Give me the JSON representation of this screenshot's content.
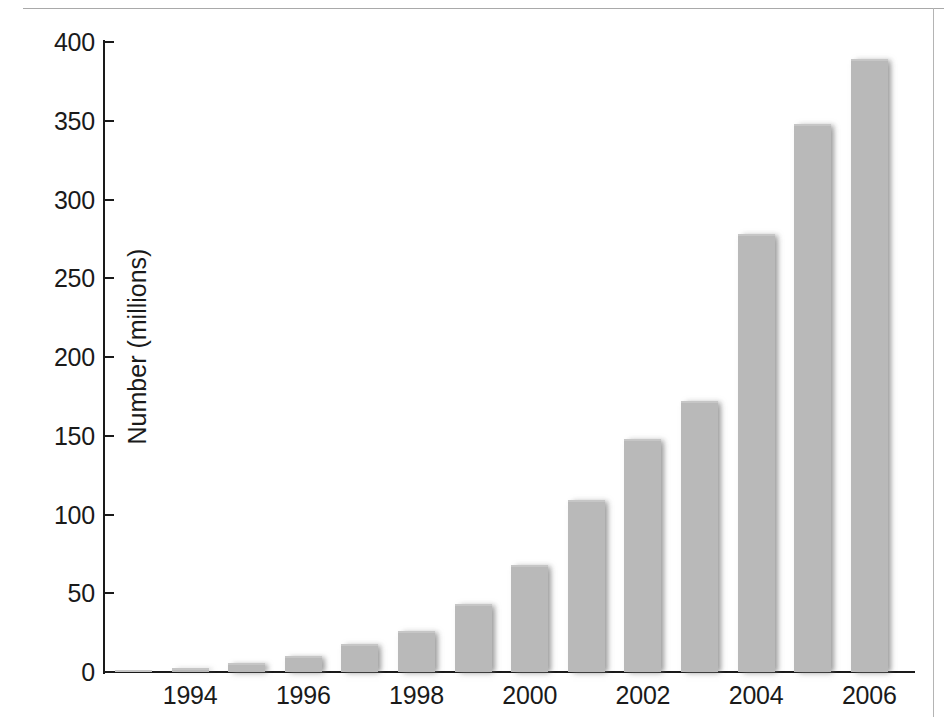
{
  "chart_data": {
    "type": "bar",
    "title": "",
    "subtitle": "",
    "xlabel": "",
    "ylabel": "Number (millions)",
    "ylim": [
      0,
      400
    ],
    "y_ticks": [
      0,
      50,
      100,
      150,
      200,
      250,
      300,
      350,
      400
    ],
    "grid": false,
    "legend": null,
    "bar_color": "#b9b9b9",
    "axis_color": "#1a1a1a",
    "categories": [
      "1993",
      "1994",
      "1995",
      "1996",
      "1997",
      "1998",
      "1999",
      "2000",
      "2001",
      "2002",
      "2003",
      "2004",
      "2005",
      "2006"
    ],
    "x_tick_labels": [
      "1994",
      "1996",
      "1998",
      "2000",
      "2002",
      "2004",
      "2006"
    ],
    "values": [
      0.5,
      2.5,
      5.5,
      10,
      18,
      26,
      43,
      68,
      109,
      148,
      172,
      278,
      348,
      389
    ],
    "series": [
      {
        "name": "Number (millions)",
        "values": [
          0.5,
          2.5,
          5.5,
          10,
          18,
          26,
          43,
          68,
          109,
          148,
          172,
          278,
          348,
          389
        ]
      }
    ]
  }
}
